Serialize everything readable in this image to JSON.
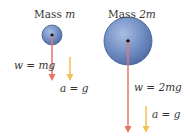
{
  "diagram": {
    "left": {
      "title_prefix": "Mass ",
      "title_var": "m",
      "weight_label": "w = mg",
      "accel_label": "a = g"
    },
    "right": {
      "title_prefix": "Mass ",
      "title_var": "2m",
      "weight_label": "w = 2mg",
      "accel_label": "a = g"
    },
    "colors": {
      "ball_fill": "#6a86bd",
      "ball_edge": "#3e5a8c",
      "weight_arrow": "#e8756a",
      "accel_arrow": "#f2c14e",
      "text": "#333333"
    }
  }
}
